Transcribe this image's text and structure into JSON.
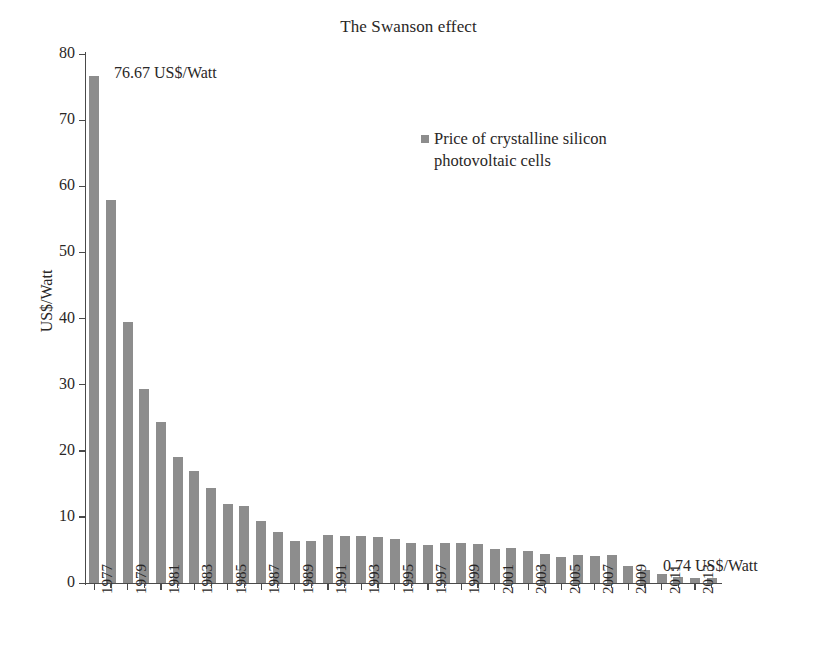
{
  "chart_data": {
    "type": "bar",
    "title": "The Swanson effect",
    "xlabel": "",
    "ylabel": "US$/Watt",
    "ylim": [
      0,
      80
    ],
    "ytick_step": 10,
    "yticks": [
      0,
      10,
      20,
      30,
      40,
      50,
      60,
      70,
      80
    ],
    "grid": false,
    "legend_position": "upper-center-right",
    "legend": [
      "Price of crystalline silicon photovoltaic cells"
    ],
    "series": [
      {
        "name": "Price of crystalline silicon photovoltaic cells",
        "color": "#8d8d8d",
        "values": [
          76.67,
          57.9,
          39.5,
          29.3,
          24.4,
          19.0,
          17.0,
          14.4,
          12.0,
          11.6,
          9.4,
          7.7,
          6.3,
          6.4,
          7.2,
          7.1,
          7.1,
          6.9,
          6.6,
          6.0,
          5.8,
          6.0,
          6.1,
          5.9,
          5.2,
          5.3,
          4.8,
          4.4,
          4.0,
          4.2,
          4.1,
          4.3,
          2.5,
          1.9,
          1.4,
          0.9,
          0.79,
          0.74
        ]
      }
    ],
    "categories": [
      "1977",
      "1978",
      "1979",
      "1980",
      "1981",
      "1982",
      "1983",
      "1984",
      "1985",
      "1986",
      "1987",
      "1988",
      "1989",
      "1990",
      "1991",
      "1992",
      "1993",
      "1994",
      "1995",
      "1996",
      "1997",
      "1998",
      "1999",
      "2000",
      "2001",
      "2002",
      "2003",
      "2004",
      "2005",
      "2006",
      "2007",
      "2008",
      "2009",
      "2010",
      "2011",
      "2012",
      "2013",
      "2014"
    ],
    "xtick_labels": [
      "1977",
      "1979",
      "1981",
      "1983",
      "1985",
      "1987",
      "1989",
      "1991",
      "1993",
      "1995",
      "1997",
      "1999",
      "2001",
      "2003",
      "2005",
      "2007",
      "2009",
      "2011",
      "2013"
    ],
    "annotations": [
      {
        "name": "first-value",
        "text": "76.67 US$/Watt",
        "category": "1977",
        "value": 76.67
      },
      {
        "name": "last-value",
        "text": "0.74 US$/Watt",
        "category": "2014",
        "value": 0.74
      }
    ]
  }
}
